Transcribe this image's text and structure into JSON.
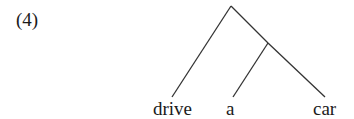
{
  "example_number": "(4)",
  "tree": {
    "root": {
      "x": 231,
      "y": 6
    },
    "inner_node": {
      "x": 268,
      "y": 43
    },
    "leaves": [
      {
        "label": "drive",
        "x": 172,
        "y": 97
      },
      {
        "label": "a",
        "x": 233,
        "y": 97
      },
      {
        "label": "car",
        "x": 325,
        "y": 97
      }
    ],
    "line_color": "#333333"
  }
}
